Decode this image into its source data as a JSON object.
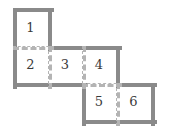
{
  "figure": {
    "title": "",
    "kind": "polyomino-net-diagram",
    "background_color": "#ffffff",
    "solid_edge_color": "#8a8a8a",
    "dashed_edge_color": "#b4b4b4",
    "label_color": "#3a3a3a",
    "cells": [
      {
        "id": "cell-1",
        "label": "1",
        "x": 13,
        "y": 8,
        "w": 35,
        "h": 38
      },
      {
        "id": "cell-2",
        "label": "2",
        "x": 13,
        "y": 46,
        "w": 35,
        "h": 37
      },
      {
        "id": "cell-3",
        "label": "3",
        "x": 48,
        "y": 46,
        "w": 34,
        "h": 37
      },
      {
        "id": "cell-4",
        "label": "4",
        "x": 82,
        "y": 46,
        "w": 34,
        "h": 37
      },
      {
        "id": "cell-5",
        "label": "5",
        "x": 82,
        "y": 83,
        "w": 34,
        "h": 37
      },
      {
        "id": "cell-6",
        "label": "6",
        "x": 116,
        "y": 83,
        "w": 35,
        "h": 37
      }
    ],
    "solid_edges": [
      {
        "name": "outline-top-cell1",
        "orient": "h",
        "x": 13,
        "y": 8,
        "len": 35
      },
      {
        "name": "outline-left-cell1",
        "orient": "v",
        "x": 13,
        "y": 8,
        "len": 38
      },
      {
        "name": "outline-right-cell1",
        "orient": "v",
        "x": 48,
        "y": 8,
        "len": 38
      },
      {
        "name": "outline-top-cell3-cell4",
        "orient": "h",
        "x": 48,
        "y": 46,
        "len": 68
      },
      {
        "name": "outline-left-cell2",
        "orient": "v",
        "x": 13,
        "y": 46,
        "len": 37
      },
      {
        "name": "outline-bottom-cell2-cell3",
        "orient": "h",
        "x": 13,
        "y": 83,
        "len": 69
      },
      {
        "name": "outline-right-cell4",
        "orient": "v",
        "x": 116,
        "y": 46,
        "len": 37
      },
      {
        "name": "outline-left-cell5",
        "orient": "v",
        "x": 82,
        "y": 83,
        "len": 37
      },
      {
        "name": "outline-top-cell6",
        "orient": "h",
        "x": 116,
        "y": 83,
        "len": 35
      },
      {
        "name": "outline-right-cell6",
        "orient": "v",
        "x": 151,
        "y": 83,
        "len": 37
      },
      {
        "name": "outline-bottom-cell5-cell6",
        "orient": "h",
        "x": 82,
        "y": 120,
        "len": 69
      }
    ],
    "dashed_edges": [
      {
        "name": "fold-cell1-cell2",
        "orient": "h",
        "x": 13,
        "y": 46,
        "len": 35
      },
      {
        "name": "fold-cell2-cell3",
        "orient": "v",
        "x": 48,
        "y": 46,
        "len": 37
      },
      {
        "name": "fold-cell3-cell4",
        "orient": "v",
        "x": 82,
        "y": 46,
        "len": 37
      },
      {
        "name": "fold-cell4-cell5",
        "orient": "h",
        "x": 82,
        "y": 83,
        "len": 34
      },
      {
        "name": "fold-cell5-cell6",
        "orient": "v",
        "x": 116,
        "y": 83,
        "len": 37
      }
    ]
  }
}
